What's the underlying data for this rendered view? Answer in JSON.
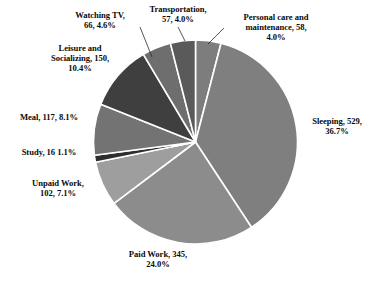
{
  "chart_data": {
    "type": "pie",
    "title": "",
    "subtitle": "",
    "xlabel": "",
    "ylabel": "",
    "legend_position": "none",
    "grid": false,
    "total": 1440,
    "units": "minutes per day",
    "start_angle_deg": 0,
    "direction": "clockwise",
    "categories": [
      "Personal care and maintenance",
      "Sleeping",
      "Paid Work",
      "Unpaid Work",
      "Study",
      "Meal",
      "Leisure and Socializing",
      "Watching TV",
      "Transportation"
    ],
    "values": [
      58,
      529,
      345,
      102,
      16,
      117,
      150,
      66,
      57
    ],
    "percents": [
      4.0,
      36.7,
      24.0,
      7.1,
      1.1,
      8.1,
      10.4,
      4.6,
      4.0
    ],
    "colors": [
      "#7d7d7d",
      "#7f7f7f",
      "#8c8c8c",
      "#9e9e9e",
      "#2e2e2e",
      "#737373",
      "#3f3f3f",
      "#6e6e6e",
      "#5a5a5a"
    ],
    "slice_separator_color": "#ffffff",
    "slices": [
      {
        "name": "Personal care and maintenance",
        "label": "Personal care and\nmaintenance, 58,\n4.0%",
        "value": 58,
        "percent": 4.0,
        "color": "#7d7d7d",
        "start_deg": 0.0,
        "end_deg": 14.5
      },
      {
        "name": "Sleeping",
        "label": "Sleeping, 529,\n36.7%",
        "value": 529,
        "percent": 36.7,
        "color": "#7f7f7f",
        "start_deg": 14.5,
        "end_deg": 146.75
      },
      {
        "name": "Paid Work",
        "label": "Paid Work, 345,\n24.0%",
        "value": 345,
        "percent": 24.0,
        "color": "#8c8c8c",
        "start_deg": 146.75,
        "end_deg": 233.0
      },
      {
        "name": "Unpaid Work",
        "label": "Unpaid Work,\n102, 7.1%",
        "value": 102,
        "percent": 7.1,
        "color": "#9e9e9e",
        "start_deg": 233.0,
        "end_deg": 258.5
      },
      {
        "name": "Study",
        "label": "Study, 16  1.1%",
        "value": 16,
        "percent": 1.1,
        "color": "#2e2e2e",
        "start_deg": 258.5,
        "end_deg": 262.5
      },
      {
        "name": "Meal",
        "label": "Meal, 117, 8.1%",
        "value": 117,
        "percent": 8.1,
        "color": "#737373",
        "start_deg": 262.5,
        "end_deg": 291.75
      },
      {
        "name": "Leisure and Socializing",
        "label": "Leisure and\nSocializing, 150,\n10.4%",
        "value": 150,
        "percent": 10.4,
        "color": "#3f3f3f",
        "start_deg": 291.75,
        "end_deg": 329.25
      },
      {
        "name": "Watching TV",
        "label": "Watching TV,\n66, 4.6%",
        "value": 66,
        "percent": 4.6,
        "color": "#6e6e6e",
        "start_deg": 329.25,
        "end_deg": 345.75
      },
      {
        "name": "Transportation",
        "label": "Transportation,\n57, 4.0%",
        "value": 57,
        "percent": 4.0,
        "color": "#5a5a5a",
        "start_deg": 345.75,
        "end_deg": 360.0
      }
    ],
    "geometry": {
      "center_x": 195.5,
      "center_y": 142,
      "radius": 102
    },
    "leader_lines": [
      {
        "name": "watching-tv-leader",
        "x1": 140,
        "y1": 27,
        "x2": 152,
        "y2": 57
      },
      {
        "name": "transportation-leader",
        "x1": 178,
        "y1": 27,
        "x2": 185,
        "y2": 41
      },
      {
        "name": "personal-care-leader",
        "x1": 224,
        "y1": 28,
        "x2": 208,
        "y2": 44
      }
    ]
  }
}
